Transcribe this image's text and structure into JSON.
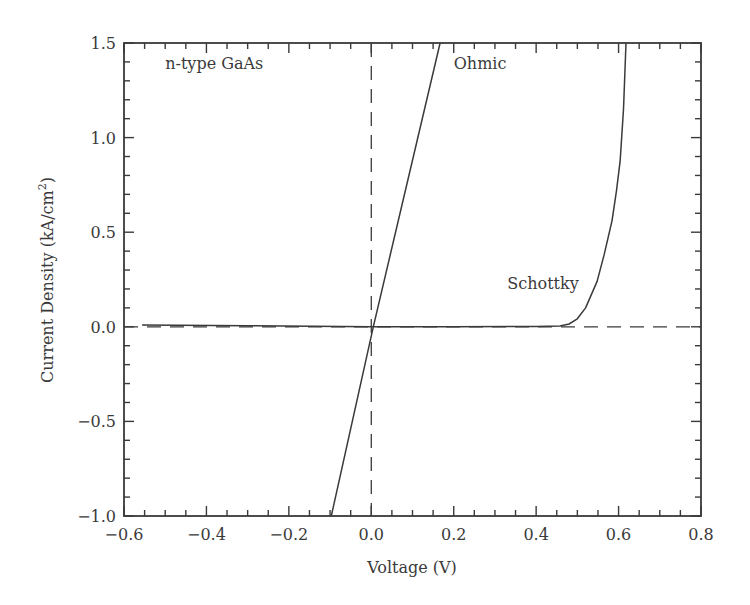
{
  "chart_data": {
    "type": "line",
    "title": "",
    "xlabel": "Voltage (V)",
    "ylabel_main": "Current Density (kA/cm",
    "ylabel_sup": "2",
    "ylabel_tail": ")",
    "xlim": [
      -0.6,
      0.8
    ],
    "ylim": [
      -1.0,
      1.5
    ],
    "x_major_ticks": [
      -0.6,
      -0.4,
      -0.2,
      0.0,
      0.2,
      0.4,
      0.6,
      0.8
    ],
    "x_tick_labels": [
      "−0.6",
      "−0.4",
      "−0.2",
      "0.0",
      "0.2",
      "0.4",
      "0.6",
      "0.8"
    ],
    "x_minor_step": 0.05,
    "y_major_ticks": [
      -1.0,
      -0.5,
      0.0,
      0.5,
      1.0,
      1.5
    ],
    "y_tick_labels": [
      "−1.0",
      "−0.5",
      "0.0",
      "0.5",
      "1.0",
      "1.5"
    ],
    "y_minor_step": 0.1,
    "grid": false,
    "reference_lines": [
      {
        "name": "zero-current",
        "orientation": "horizontal",
        "value": 0.0,
        "style": "dashed"
      },
      {
        "name": "zero-voltage",
        "orientation": "vertical",
        "value": 0.0,
        "style": "dashed"
      }
    ],
    "series": [
      {
        "name": "Ohmic",
        "x": [
          -0.097,
          0.005,
          0.167
        ],
        "y": [
          -1.0,
          0.0,
          1.5
        ]
      },
      {
        "name": "Schottky",
        "x": [
          -0.556,
          -0.3,
          0.0,
          0.2,
          0.4,
          0.458,
          0.48,
          0.499,
          0.52,
          0.548,
          0.565,
          0.584,
          0.595,
          0.604,
          0.612,
          0.618
        ],
        "y": [
          0.01,
          0.006,
          0.0,
          0.0,
          0.002,
          0.005,
          0.015,
          0.04,
          0.1,
          0.24,
          0.38,
          0.56,
          0.72,
          0.88,
          1.15,
          1.5
        ]
      }
    ],
    "annotations": [
      {
        "text": "n-type GaAs",
        "x": -0.5,
        "y": 1.36
      },
      {
        "text": "Ohmic",
        "x": 0.2,
        "y": 1.36
      },
      {
        "text": "Schottky",
        "x": 0.33,
        "y": 0.2
      }
    ]
  }
}
